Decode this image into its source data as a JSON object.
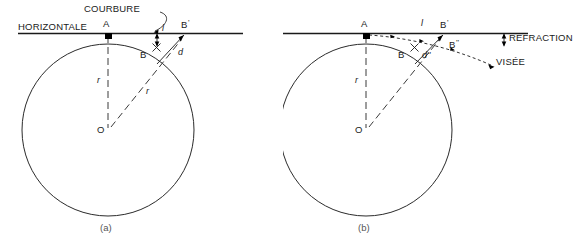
{
  "figure": {
    "title_caps": {
      "horizontale": "HORIZONTALE",
      "courbure": "COURBURE",
      "refraction": "RÉFRACTION",
      "visee": "VISÉE"
    },
    "colors": {
      "ink": "#1a1a1a",
      "arc": "#2b2b2b",
      "caption": "#555555",
      "background": "#ffffff"
    }
  },
  "panel_a": {
    "caption": "(a)",
    "points": {
      "a": "A",
      "b": "B",
      "b_prime": "B",
      "b_prime_mark": "'",
      "o": "O"
    },
    "labels": {
      "horizontale": "HORIZONTALE",
      "courbure": "COURBURE",
      "radius_vertical": "r",
      "radius_oblique": "r",
      "segment_l": "l",
      "segment_d": "d"
    }
  },
  "panel_b": {
    "caption": "(b)",
    "points": {
      "a": "A",
      "b": "B",
      "b_prime": "B",
      "b_prime_mark": "'",
      "b_second": "B",
      "b_second_mark": "''",
      "o": "O"
    },
    "labels": {
      "radius_vertical": "r",
      "segment_l": "l",
      "segment_d_second": "d''",
      "refraction": "RÉFRACTION",
      "visee": "VISÉE"
    }
  }
}
